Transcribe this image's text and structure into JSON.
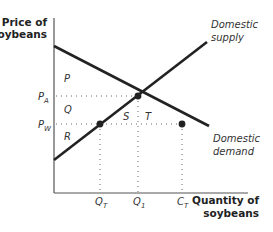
{
  "diagram": {
    "type": "supply-demand-tariff",
    "y_axis_title": [
      "Price of",
      "soybeans"
    ],
    "x_axis_title": [
      "Quantity of",
      "soybeans"
    ],
    "curves": {
      "supply": {
        "label": [
          "Domestic",
          "supply"
        ]
      },
      "demand": {
        "label": [
          "Domestic",
          "demand"
        ]
      }
    },
    "price_ticks": [
      {
        "main": "P",
        "sub": "A"
      },
      {
        "main": "P",
        "sub": "W"
      }
    ],
    "quantity_ticks": [
      {
        "main": "Q",
        "sub": "T"
      },
      {
        "main": "Q",
        "sub": "1"
      },
      {
        "main": "C",
        "sub": "T"
      }
    ],
    "areas": {
      "P": "P",
      "Q": "Q",
      "R": "R",
      "S": "S",
      "T": "T"
    },
    "colors": {
      "axis": "#555555",
      "curve": "#222222",
      "guide": "#666666",
      "point": "#222222"
    }
  }
}
